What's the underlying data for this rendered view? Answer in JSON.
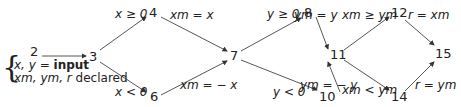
{
  "nodes": [
    {
      "id": "2",
      "label": "2"
    },
    {
      "id": "3",
      "label": "3"
    },
    {
      "id": "4",
      "label": "4"
    },
    {
      "id": "6",
      "label": "6"
    },
    {
      "id": "7",
      "label": "7"
    },
    {
      "id": "8",
      "label": "8"
    },
    {
      "id": "10",
      "label": "10"
    },
    {
      "id": "11",
      "label": "11"
    },
    {
      "id": "12",
      "label": "12"
    },
    {
      "id": "14",
      "label": "14"
    },
    {
      "id": "15",
      "label": "15"
    }
  ],
  "annotation": {
    "line1_vars": "x, y = ",
    "line1_bold": "input",
    "line2_vars": "xm, ym, r",
    "line2_text": " declared"
  },
  "edges": [
    {
      "from": "2",
      "to": "3",
      "label": ""
    },
    {
      "from": "3",
      "to": "4",
      "label": "x ≥ 0"
    },
    {
      "from": "3",
      "to": "6",
      "label": "x < 0"
    },
    {
      "from": "4",
      "to": "7",
      "label": "xm = x"
    },
    {
      "from": "6",
      "to": "7",
      "label": "xm = − x"
    },
    {
      "from": "7",
      "to": "8",
      "label": "y ≥ 0"
    },
    {
      "from": "7",
      "to": "10",
      "label": "y < 0"
    },
    {
      "from": "8",
      "to": "11",
      "label": "ym = y"
    },
    {
      "from": "10",
      "to": "11",
      "label": "ym = − y"
    },
    {
      "from": "11",
      "to": "12",
      "label": "xm ≥ ym"
    },
    {
      "from": "11",
      "to": "14",
      "label": "xm < ym"
    },
    {
      "from": "12",
      "to": "15",
      "label": "r = xm"
    },
    {
      "from": "14",
      "to": "15",
      "label": "r = ym"
    }
  ]
}
